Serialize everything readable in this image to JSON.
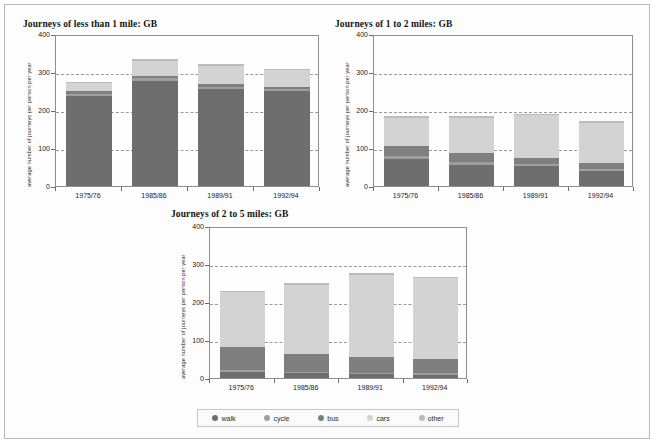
{
  "figure": {
    "ylabel": "average number of journeys per person per year",
    "y_ticks": [
      "0",
      "100",
      "200",
      "300",
      "400"
    ],
    "ylim": [
      0,
      400
    ],
    "categories": [
      "1975/76",
      "1985/86",
      "1989/91",
      "1992/94"
    ],
    "series_names": [
      "walk",
      "cycle",
      "bus",
      "cars",
      "other"
    ],
    "colors": {
      "walk": "#6e6e6e",
      "cycle": "#9e9e9e",
      "bus": "#7f7f7f",
      "cars": "#d3d3d3",
      "other": "#bcbcbc",
      "grid": "#9a9a9a",
      "axis": "#8e8e8e",
      "frame": "#b9b9b9"
    }
  },
  "legend": {
    "position": "bottom-center",
    "items": [
      {
        "label": "walk",
        "color": "#6e6e6e"
      },
      {
        "label": "cycle",
        "color": "#9e9e9e"
      },
      {
        "label": "bus",
        "color": "#7f7f7f"
      },
      {
        "label": "cars",
        "color": "#d3d3d3"
      },
      {
        "label": "other",
        "color": "#bcbcbc"
      }
    ]
  },
  "chart_data": [
    {
      "type": "bar",
      "id": "under-1-mile",
      "title": "Journeys of less than 1 mile: GB",
      "stacked": true,
      "xlabel": "",
      "ylabel": "average number of journeys per person per year",
      "ylim": [
        0,
        400
      ],
      "yticks": [
        0,
        100,
        200,
        300,
        400
      ],
      "grid": true,
      "categories": [
        "1975/76",
        "1985/86",
        "1989/91",
        "1992/94"
      ],
      "series": [
        {
          "name": "walk",
          "values": [
            238,
            277,
            256,
            250
          ]
        },
        {
          "name": "cycle",
          "values": [
            5,
            6,
            5,
            4
          ]
        },
        {
          "name": "bus",
          "values": [
            8,
            6,
            8,
            6
          ]
        },
        {
          "name": "cars",
          "values": [
            19,
            41,
            47,
            44
          ]
        },
        {
          "name": "other",
          "values": [
            4,
            4,
            4,
            4
          ]
        }
      ],
      "totals": [
        274,
        334,
        320,
        308
      ]
    },
    {
      "type": "bar",
      "id": "1-to-2-miles",
      "title": "Journeys of 1 to 2 miles: GB",
      "stacked": true,
      "xlabel": "",
      "ylabel": "average number of journeys per person per year",
      "ylim": [
        0,
        400
      ],
      "yticks": [
        0,
        100,
        200,
        300,
        400
      ],
      "grid": true,
      "categories": [
        "1975/76",
        "1985/86",
        "1989/91",
        "1992/94"
      ],
      "series": [
        {
          "name": "walk",
          "values": [
            72,
            56,
            52,
            39
          ]
        },
        {
          "name": "cycle",
          "values": [
            8,
            7,
            6,
            6
          ]
        },
        {
          "name": "bus",
          "values": [
            26,
            23,
            17,
            15
          ]
        },
        {
          "name": "cars",
          "values": [
            74,
            94,
            111,
            106
          ]
        },
        {
          "name": "other",
          "values": [
            4,
            4,
            4,
            4
          ]
        }
      ],
      "totals": [
        184,
        184,
        190,
        170
      ]
    },
    {
      "type": "bar",
      "id": "2-to-5-miles",
      "title": "Journeys of 2 to 5 miles: GB",
      "stacked": true,
      "xlabel": "",
      "ylabel": "average number of journeys per person per year",
      "ylim": [
        0,
        400
      ],
      "yticks": [
        0,
        100,
        200,
        300,
        400
      ],
      "grid": true,
      "categories": [
        "1975/76",
        "1985/86",
        "1989/91",
        "1992/94"
      ],
      "series": [
        {
          "name": "walk",
          "values": [
            16,
            12,
            11,
            9
          ]
        },
        {
          "name": "cycle",
          "values": [
            4,
            3,
            3,
            3
          ]
        },
        {
          "name": "bus",
          "values": [
            61,
            48,
            42,
            37
          ]
        },
        {
          "name": "cars",
          "values": [
            146,
            183,
            216,
            214
          ]
        },
        {
          "name": "other",
          "values": [
            3,
            3,
            5,
            4
          ]
        }
      ],
      "totals": [
        230,
        249,
        277,
        267
      ]
    }
  ]
}
